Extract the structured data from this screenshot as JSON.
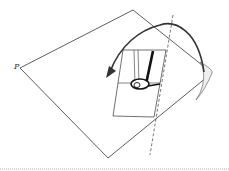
{
  "diagram": {
    "type": "origami-fold-step",
    "labels": {
      "corner_p": "P"
    },
    "colors": {
      "line": "#333333",
      "arrow": "#333333",
      "dashed_line": "#555555",
      "separator": "#999999",
      "background": "#ffffff"
    }
  }
}
